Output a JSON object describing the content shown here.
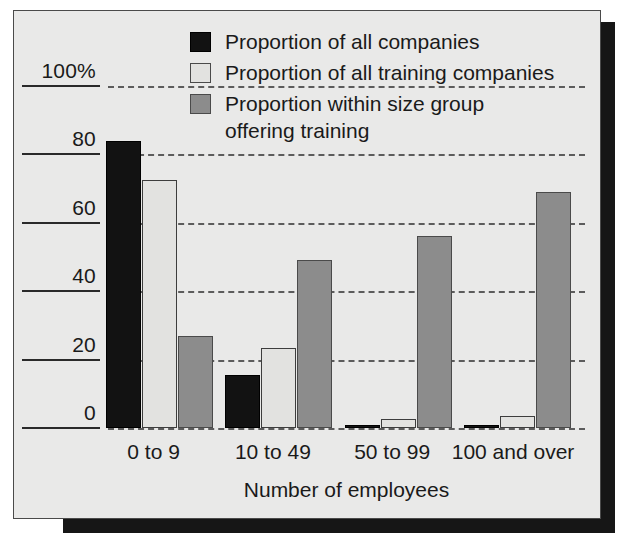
{
  "chart_data": {
    "type": "bar",
    "title": "",
    "xlabel": "Number of employees",
    "ylabel": "",
    "categories": [
      "0 to 9",
      "10 to 49",
      "50 to 99",
      "100 and over"
    ],
    "series": [
      {
        "name": "Proportion of all companies",
        "color": "#121212",
        "values": [
          84,
          15.5,
          0.6,
          0.6
        ]
      },
      {
        "name": "Proportion of all training companies",
        "color": "#e2e2e0",
        "values": [
          72.5,
          23.5,
          2.5,
          3.5
        ]
      },
      {
        "name": "Proportion within size group offering training",
        "color": "#8c8c8c",
        "values": [
          27,
          49,
          56,
          69
        ]
      }
    ],
    "ylim": [
      0,
      100
    ],
    "ytick_labels": [
      "100%",
      "80",
      "60",
      "40",
      "20",
      "0"
    ],
    "ytick_values": [
      100,
      80,
      60,
      40,
      20,
      0
    ],
    "grid": true,
    "grid_style": "dashed-horizontal",
    "legend_position": "top-center"
  },
  "legend": {
    "items": [
      {
        "label": "Proportion of all companies",
        "label_line2": ""
      },
      {
        "label": "Proportion of all training companies",
        "label_line2": ""
      },
      {
        "label": "Proportion within size group",
        "label_line2": "offering training"
      }
    ]
  },
  "axes": {
    "y_ticks": [
      {
        "label": "100%"
      },
      {
        "label": "80"
      },
      {
        "label": "60"
      },
      {
        "label": "40"
      },
      {
        "label": "20"
      },
      {
        "label": "0"
      }
    ],
    "x_ticks": [
      {
        "label": "0 to 9"
      },
      {
        "label": "10 to 49"
      },
      {
        "label": "50 to 99"
      },
      {
        "label": "100 and over"
      }
    ],
    "x_title": "Number of employees"
  },
  "colors": {
    "series_1": "#121212",
    "series_2": "#e2e2e0",
    "series_3": "#8c8c8c",
    "background": "#e9e9e8",
    "frame": "#4a4a4a",
    "grid": "#5c5c5c",
    "shadow": "#161616"
  }
}
